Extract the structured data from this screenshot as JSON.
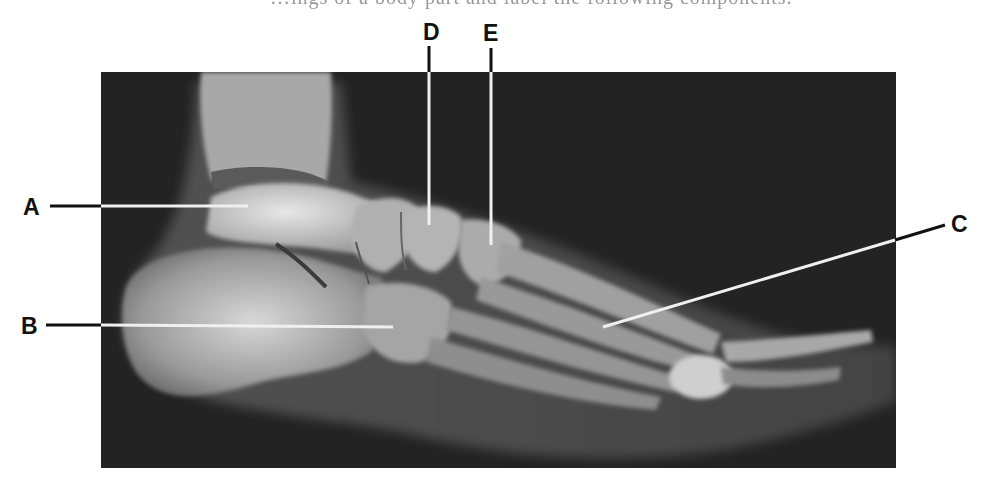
{
  "figure": {
    "caption_fragment": "…ings of a body part and label the following components.",
    "image_description": "Lateral radiograph (X-ray) of the foot and ankle",
    "background_color": "#232323",
    "pointer_line_color_inside": "#f0f0f0",
    "pointer_line_color_outside": "#111111"
  },
  "labels": [
    {
      "id": "A",
      "text": "A",
      "side": "left"
    },
    {
      "id": "B",
      "text": "B",
      "side": "left"
    },
    {
      "id": "C",
      "text": "C",
      "side": "right"
    },
    {
      "id": "D",
      "text": "D",
      "side": "top"
    },
    {
      "id": "E",
      "text": "E",
      "side": "top"
    }
  ]
}
